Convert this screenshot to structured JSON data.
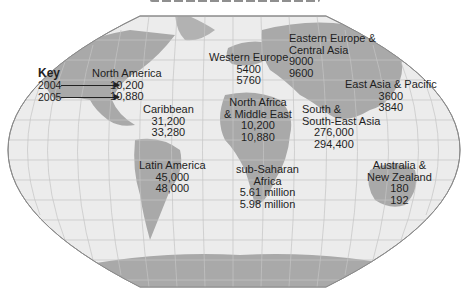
{
  "map": {
    "projection": "world outline map with graticule",
    "key": {
      "title": "Key",
      "years": [
        "2004",
        "2005"
      ]
    },
    "regions": [
      {
        "id": "north-america",
        "name": [
          "North America"
        ],
        "v2004": "10,200",
        "v2005": "10,880"
      },
      {
        "id": "caribbean",
        "name": [
          "Caribbean"
        ],
        "v2004": "31,200",
        "v2005": "33,280"
      },
      {
        "id": "latin-america",
        "name": [
          "Latin America"
        ],
        "v2004": "45,000",
        "v2005": "48,000"
      },
      {
        "id": "western-europe",
        "name": [
          "Western Europe"
        ],
        "v2004": "5400",
        "v2005": "5760"
      },
      {
        "id": "eastern-europe-central-asia",
        "name": [
          "Eastern Europe &",
          "Central Asia"
        ],
        "v2004": "9000",
        "v2005": "9600"
      },
      {
        "id": "north-africa-middle-east",
        "name": [
          "North Africa",
          "& Middle East"
        ],
        "v2004": "10,200",
        "v2005": "10,880"
      },
      {
        "id": "east-asia-pacific",
        "name": [
          "East Asia & Pacific"
        ],
        "v2004": "3600",
        "v2005": "3840"
      },
      {
        "id": "south-southeast-asia",
        "name": [
          "South &",
          "South-East Asia"
        ],
        "v2004": "276,000",
        "v2005": "294,400"
      },
      {
        "id": "sub-saharan-africa",
        "name": [
          "sub-Saharan",
          "Africa"
        ],
        "v2004": "5.61 million",
        "v2005": "5.98 million"
      },
      {
        "id": "australia-new-zealand",
        "name": [
          "Australia &",
          "New Zealand"
        ],
        "v2004": "180",
        "v2005": "192"
      }
    ],
    "colors": {
      "ocean": "#ececec",
      "land": "#a9a9a9",
      "grid": "#c4c4c4",
      "outline": "#888888",
      "text": "#1e1e1e"
    }
  }
}
